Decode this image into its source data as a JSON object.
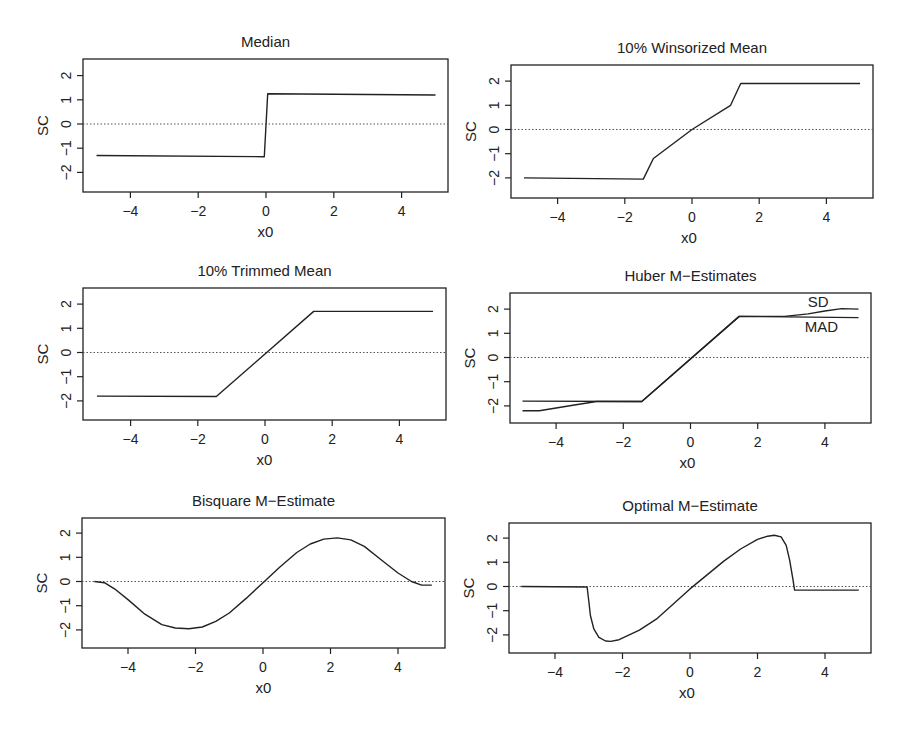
{
  "figure": {
    "layout": "3 rows x 2 columns",
    "background": "#ffffff",
    "line_color": "#222222"
  },
  "chart_data": [
    {
      "type": "line",
      "title": "Median",
      "xlabel": "x0",
      "ylabel": "SC",
      "xlim": [
        -5.4,
        5.4
      ],
      "ylim": [
        -2.7,
        2.7
      ],
      "xticks": [
        -4,
        -2,
        0,
        2,
        4
      ],
      "xtick_labels": [
        "−4",
        "−2",
        "0",
        "2",
        "4"
      ],
      "yticks": [
        -2,
        -1,
        0,
        1,
        2
      ],
      "ytick_labels": [
        "−2",
        "−1",
        "0",
        "1",
        "2"
      ],
      "reference_line": {
        "y": 0,
        "style": "dotted"
      },
      "grid": false,
      "series": [
        {
          "name": "SC",
          "x": [
            -5,
            -0.05,
            0.05,
            5
          ],
          "y": [
            -1.3,
            -1.35,
            1.25,
            1.2
          ]
        }
      ]
    },
    {
      "type": "line",
      "title": "10% Winsorized Mean",
      "xlabel": "x0",
      "ylabel": "SC",
      "xlim": [
        -5.4,
        5.4
      ],
      "ylim": [
        -2.7,
        2.7
      ],
      "xticks": [
        -4,
        -2,
        0,
        2,
        4
      ],
      "xtick_labels": [
        "−4",
        "−2",
        "0",
        "2",
        "4"
      ],
      "yticks": [
        -2,
        -1,
        0,
        1,
        2
      ],
      "ytick_labels": [
        "−2",
        "−1",
        "0",
        "1",
        "2"
      ],
      "reference_line": {
        "y": 0,
        "style": "dotted"
      },
      "grid": false,
      "series": [
        {
          "name": "SC",
          "x": [
            -5,
            -1.45,
            -1.15,
            0,
            1.15,
            1.45,
            5
          ],
          "y": [
            -2.0,
            -2.05,
            -1.2,
            0,
            1.0,
            1.9,
            1.9
          ]
        }
      ]
    },
    {
      "type": "line",
      "title": "10% Trimmed Mean",
      "xlabel": "x0",
      "ylabel": "SC",
      "xlim": [
        -5.4,
        5.4
      ],
      "ylim": [
        -2.7,
        2.7
      ],
      "xticks": [
        -4,
        -2,
        0,
        2,
        4
      ],
      "xtick_labels": [
        "−4",
        "−2",
        "0",
        "2",
        "4"
      ],
      "yticks": [
        -2,
        -1,
        0,
        1,
        2
      ],
      "ytick_labels": [
        "−2",
        "−1",
        "0",
        "1",
        "2"
      ],
      "reference_line": {
        "y": 0,
        "style": "dotted"
      },
      "grid": false,
      "series": [
        {
          "name": "SC",
          "x": [
            -5,
            -1.45,
            1.45,
            5
          ],
          "y": [
            -1.8,
            -1.82,
            1.7,
            1.7
          ]
        }
      ]
    },
    {
      "type": "line",
      "title": "Huber M−Estimates",
      "xlabel": "x0",
      "ylabel": "SC",
      "xlim": [
        -5.4,
        5.4
      ],
      "ylim": [
        -2.7,
        2.7
      ],
      "xticks": [
        -4,
        -2,
        0,
        2,
        4
      ],
      "xtick_labels": [
        "−4",
        "−2",
        "0",
        "2",
        "4"
      ],
      "yticks": [
        -2,
        -1,
        0,
        1,
        2
      ],
      "ytick_labels": [
        "−2",
        "−1",
        "0",
        "1",
        "2"
      ],
      "reference_line": {
        "y": 0,
        "style": "dotted"
      },
      "grid": false,
      "annotations": [
        {
          "text": "SD",
          "x": 3.8,
          "y": 2.1
        },
        {
          "text": "MAD",
          "x": 3.9,
          "y": 1.05
        }
      ],
      "series": [
        {
          "name": "MAD",
          "x": [
            -5,
            -1.45,
            1.45,
            5
          ],
          "y": [
            -1.8,
            -1.82,
            1.7,
            1.65
          ]
        },
        {
          "name": "SD",
          "x": [
            -5,
            -4.5,
            -3.5,
            -2.8,
            -1.45,
            1.45,
            2.8,
            3.5,
            4.0,
            4.5,
            5
          ],
          "y": [
            -2.2,
            -2.2,
            -1.97,
            -1.82,
            -1.82,
            1.7,
            1.7,
            1.8,
            1.92,
            2.02,
            2.0
          ]
        }
      ]
    },
    {
      "type": "line",
      "title": "Bisquare M−Estimate",
      "xlabel": "x0",
      "ylabel": "SC",
      "xlim": [
        -5.4,
        5.4
      ],
      "ylim": [
        -2.7,
        2.7
      ],
      "xticks": [
        -4,
        -2,
        0,
        2,
        4
      ],
      "xtick_labels": [
        "−4",
        "−2",
        "0",
        "2",
        "4"
      ],
      "yticks": [
        -2,
        -1,
        0,
        1,
        2
      ],
      "ytick_labels": [
        "−2",
        "−1",
        "0",
        "1",
        "2"
      ],
      "reference_line": {
        "y": 0,
        "style": "dotted"
      },
      "grid": false,
      "series": [
        {
          "name": "SC",
          "x": [
            -5,
            -4.7,
            -4.4,
            -4.0,
            -3.5,
            -3.0,
            -2.6,
            -2.2,
            -1.8,
            -1.4,
            -1.0,
            -0.5,
            0,
            0.5,
            1.0,
            1.4,
            1.8,
            2.2,
            2.6,
            3.0,
            3.5,
            4.0,
            4.4,
            4.7,
            5
          ],
          "y": [
            0.0,
            -0.05,
            -0.3,
            -0.75,
            -1.35,
            -1.78,
            -1.92,
            -1.95,
            -1.88,
            -1.65,
            -1.3,
            -0.7,
            -0.05,
            0.6,
            1.2,
            1.55,
            1.75,
            1.8,
            1.72,
            1.45,
            0.9,
            0.35,
            0.0,
            -0.15,
            -0.15
          ]
        }
      ]
    },
    {
      "type": "line",
      "title": "Optimal M−Estimate",
      "xlabel": "x0",
      "ylabel": "SC",
      "xlim": [
        -5.4,
        5.4
      ],
      "ylim": [
        -2.7,
        2.7
      ],
      "xticks": [
        -4,
        -2,
        0,
        2,
        4
      ],
      "xtick_labels": [
        "−4",
        "−2",
        "0",
        "2",
        "4"
      ],
      "yticks": [
        -2,
        -1,
        0,
        1,
        2
      ],
      "ytick_labels": [
        "−2",
        "−1",
        "0",
        "1",
        "2"
      ],
      "reference_line": {
        "y": 0,
        "style": "dotted"
      },
      "grid": false,
      "series": [
        {
          "name": "SC",
          "x": [
            -5,
            -3.05,
            -3.0,
            -2.95,
            -2.85,
            -2.7,
            -2.5,
            -2.35,
            -2.1,
            -1.5,
            -1.0,
            0,
            1.0,
            1.5,
            2.0,
            2.3,
            2.5,
            2.7,
            2.85,
            2.95,
            3.05,
            3.1,
            5
          ],
          "y": [
            0.0,
            -0.02,
            -0.6,
            -1.2,
            -1.75,
            -2.1,
            -2.25,
            -2.27,
            -2.2,
            -1.8,
            -1.35,
            -0.1,
            1.05,
            1.55,
            1.95,
            2.08,
            2.12,
            2.05,
            1.7,
            1.1,
            0.3,
            -0.15,
            -0.15
          ]
        }
      ]
    }
  ],
  "panels": [
    {
      "title": "Median",
      "xlabel": "x0",
      "ylabel": "SC"
    },
    {
      "title": "10% Winsorized Mean",
      "xlabel": "x0",
      "ylabel": "SC"
    },
    {
      "title": "10% Trimmed Mean",
      "xlabel": "x0",
      "ylabel": "SC"
    },
    {
      "title": "Huber M−Estimates",
      "xlabel": "x0",
      "ylabel": "SC",
      "annotations": [
        "SD",
        "MAD"
      ]
    },
    {
      "title": "Bisquare M−Estimate",
      "xlabel": "x0",
      "ylabel": "SC"
    },
    {
      "title": "Optimal M−Estimate",
      "xlabel": "x0",
      "ylabel": "SC"
    }
  ]
}
